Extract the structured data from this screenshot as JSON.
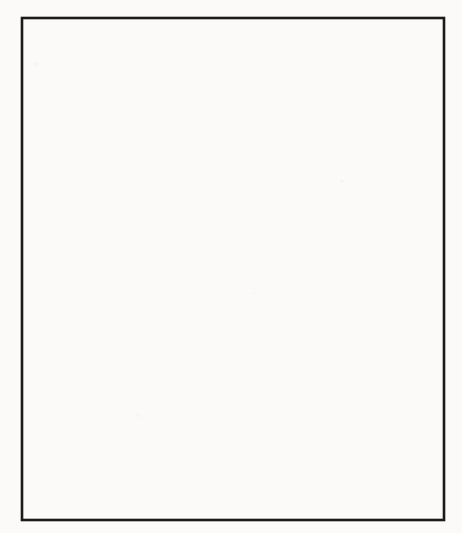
{
  "figure": {
    "domain": "diagram",
    "style": "scanned black-and-white book figure with reverse-side bleed-through",
    "frame": {
      "stroke_color": "#1a1a1a",
      "fill_color": "#fbfaf8",
      "x": 22,
      "y": 18,
      "width": 422,
      "height": 502
    },
    "ink_color": "#141414",
    "ghost_color": "#b9b2a9"
  },
  "diagrams": [
    {
      "id": "top-diagram",
      "name": "agent-migration-trail-top",
      "labels": [
        {
          "name": "label-shadow",
          "text": "Shadow",
          "x": 76,
          "y": 22,
          "size": "md"
        },
        {
          "name": "label-agent-proxy",
          "text": "Agent Proxy",
          "x": 262,
          "y": 53,
          "size": "md"
        },
        {
          "name": "label-agent",
          "text": "Agent",
          "x": 364,
          "y": 111,
          "size": "md"
        },
        {
          "name": "label-place",
          "text": "Place",
          "x": 366,
          "y": 202,
          "size": "md"
        }
      ],
      "shadow_ellipses": [
        {
          "name": "shadow-node-1",
          "cx": 66,
          "cy": 54,
          "rx": 40,
          "ry": 16,
          "rot": -4,
          "blob_rx": 19,
          "blob_ry": 6.5
        },
        {
          "name": "proxy-node-2",
          "cx": 168,
          "cy": 67,
          "rx": 40,
          "ry": 15,
          "rot": -2,
          "blob_rx": 15,
          "blob_ry": 5.5
        },
        {
          "name": "proxy-node-3",
          "cx": 256,
          "cy": 94,
          "rx": 34,
          "ry": 14,
          "rot": -3,
          "blob_rx": 14,
          "blob_ry": 5.5
        }
      ],
      "agent": {
        "name": "agent-sphere",
        "cx": 341,
        "cy": 126,
        "r": 14
      },
      "agent_place": {
        "name": "agent-current-place",
        "cx": 330,
        "cy": 138,
        "rx": 34,
        "ry": 12
      },
      "empty_place": {
        "name": "empty-place-ellipse",
        "cx": 362,
        "cy": 187,
        "rx": 38,
        "ry": 14
      },
      "arrows": [
        {
          "name": "arrow-hop-1",
          "x1": 160,
          "y1": 63,
          "x2": 112,
          "y2": 56
        },
        {
          "name": "arrow-hop-2",
          "x1": 248,
          "y1": 90,
          "x2": 196,
          "y2": 69
        },
        {
          "name": "arrow-hop-3",
          "x1": 322,
          "y1": 130,
          "x2": 274,
          "y2": 100
        }
      ],
      "trail_line": {
        "name": "shadow-trail-line",
        "x1": 334,
        "y1": 140,
        "x2": 92,
        "y2": 58
      }
    },
    {
      "id": "bottom-diagram",
      "name": "agent-migration-trail-bottom",
      "labels": [
        {
          "name": "label-shadow",
          "text": "Shadow",
          "x": 90,
          "y": 297,
          "size": "md"
        },
        {
          "name": "label-agent-proxy",
          "text": "Agent Proxy",
          "x": 270,
          "y": 321,
          "size": "md"
        },
        {
          "name": "label-agent",
          "text": "Agent",
          "x": 390,
          "y": 436,
          "size": "md"
        },
        {
          "name": "label-place",
          "text": "Place",
          "x": 372,
          "y": 482,
          "size": "md"
        }
      ],
      "shadow_ellipses": [
        {
          "name": "shadow-node-1",
          "cx": 71,
          "cy": 331,
          "rx": 40,
          "ry": 15,
          "rot": -3,
          "blob_rx": 19,
          "blob_ry": 6
        },
        {
          "name": "proxy-node-2",
          "cx": 172,
          "cy": 344,
          "rx": 37,
          "ry": 14,
          "rot": -2,
          "blob_rx": 16,
          "blob_ry": 5.5
        },
        {
          "name": "proxy-node-3",
          "cx": 266,
          "cy": 366,
          "rx": 39,
          "ry": 14,
          "rot": -3,
          "blob_rx": 16,
          "blob_ry": 6
        },
        {
          "name": "proxy-node-4",
          "cx": 334,
          "cy": 412,
          "rx": 39,
          "ry": 14,
          "rot": -2,
          "blob_rx": 16,
          "blob_ry": 6
        }
      ],
      "agent": {
        "name": "agent-sphere",
        "cx": 378,
        "cy": 454,
        "r": 16
      },
      "agent_place": {
        "name": "agent-current-place",
        "cx": 366,
        "cy": 471,
        "rx": 38,
        "ry": 14
      },
      "arrows": [
        {
          "name": "arrow-hop-1",
          "x1": 162,
          "y1": 340,
          "x2": 116,
          "y2": 334
        },
        {
          "name": "arrow-hop-2",
          "x1": 258,
          "y1": 362,
          "x2": 206,
          "y2": 346
        },
        {
          "name": "arrow-hop-3",
          "x1": 326,
          "y1": 408,
          "x2": 284,
          "y2": 376
        },
        {
          "name": "arrow-hop-4",
          "x1": 368,
          "y1": 456,
          "x2": 340,
          "y2": 426
        }
      ],
      "trail_line": {
        "name": "shadow-trail-line",
        "x1": 364,
        "y1": 472,
        "x2": 96,
        "y2": 336
      }
    }
  ],
  "bleed_through": [
    {
      "name": "ghost-line",
      "text": "Migration by agent",
      "x": 196,
      "y": 24,
      "size": 15
    },
    {
      "name": "ghost-line",
      "text": "transmits its agent",
      "x": 200,
      "y": 50,
      "size": 14
    },
    {
      "name": "ghost-line",
      "text": "(b)",
      "x": 252,
      "y": 68,
      "size": 14
    },
    {
      "name": "ghost-line",
      "text": "Agent Proxy Chain",
      "x": 200,
      "y": 96,
      "size": 15
    },
    {
      "name": "ghost-line",
      "text": "state (a)",
      "x": 226,
      "y": 118,
      "size": 14
    },
    {
      "name": "ghost-line",
      "text": "Transparent",
      "x": 224,
      "y": 145,
      "size": 14
    },
    {
      "name": "ghost-line",
      "text": "the shadow of the",
      "x": 212,
      "y": 170,
      "size": 14
    },
    {
      "name": "ghost-line",
      "text": "a shadow of it",
      "x": 226,
      "y": 194,
      "size": 14
    },
    {
      "name": "ghost-line",
      "text": "hosted on a  place",
      "x": 206,
      "y": 222,
      "size": 14
    },
    {
      "name": "ghost-line",
      "text": "references local",
      "x": 198,
      "y": 264,
      "size": 14
    },
    {
      "name": "ghost-line",
      "text": "applications",
      "x": 208,
      "y": 286,
      "size": 14
    },
    {
      "name": "ghost-line",
      "text": "agent can  return",
      "x": 200,
      "y": 312,
      "size": 14
    },
    {
      "name": "ghost-line",
      "text": "reference to the agent",
      "x": 198,
      "y": 338,
      "size": 14
    },
    {
      "name": "ghost-line",
      "text": "agent  moves  from  one",
      "x": 196,
      "y": 364,
      "size": 14
    },
    {
      "name": "ghost-line",
      "text": "at the  old place",
      "x": 212,
      "y": 392,
      "size": 14
    },
    {
      "name": "ghost-line",
      "text": "one  agent  proxy",
      "x": 210,
      "y": 444,
      "size": 14
    },
    {
      "name": "ghost-line",
      "text": "Proxy  to  the  new",
      "x": 206,
      "y": 472,
      "size": 14
    },
    {
      "name": "ghost-line",
      "text": "Figure  5.  Agent  Proxy",
      "x": 120,
      "y": 522,
      "size": 14
    }
  ]
}
